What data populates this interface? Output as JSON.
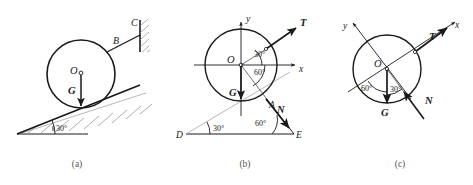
{
  "figure": {
    "background_color": "#ffffff",
    "line_color": "#1a1a1a",
    "grey_color": "#9a9a9a",
    "width": 473,
    "height": 185
  },
  "panels": [
    {
      "id": "a",
      "caption": "(a)",
      "caption_x": 77,
      "caption_y": 167,
      "description": "Cylinder resting on a 30 degree incline, tied by cord B to wall C",
      "circle": {
        "cx": 81,
        "cy": 74,
        "r": 34
      },
      "labels": [
        {
          "name": "center-label-o",
          "text": "O",
          "x": 70,
          "y": 74,
          "style": "italic"
        },
        {
          "name": "weight-label-g",
          "text": "G",
          "x": 68,
          "y": 94,
          "style": "bold-italic"
        },
        {
          "name": "cord-label-b",
          "text": "B",
          "x": 113,
          "y": 44,
          "style": "italic"
        },
        {
          "name": "wall-label-c",
          "text": "C",
          "x": 131,
          "y": 26,
          "style": "italic"
        },
        {
          "name": "incline-angle-label",
          "text": "30°",
          "x": 48,
          "y": 130,
          "style": "angle"
        }
      ]
    },
    {
      "id": "b",
      "caption": "(b)",
      "caption_x": 245,
      "caption_y": 167,
      "description": "Free body diagram with xy axes at O, forces T, G, N and triangle DAE",
      "circle": {
        "cx": 241,
        "cy": 65,
        "r": 36
      },
      "labels": [
        {
          "name": "center-label-o",
          "text": "O",
          "x": 229,
          "y": 64,
          "style": "italic"
        },
        {
          "name": "axis-label-y",
          "text": "y",
          "x": 246,
          "y": 18,
          "style": "italic"
        },
        {
          "name": "axis-label-x",
          "text": "x",
          "x": 298,
          "y": 72,
          "style": "italic"
        },
        {
          "name": "tension-label-t",
          "text": "T",
          "x": 302,
          "y": 25,
          "style": "bold-italic"
        },
        {
          "name": "weight-label-g",
          "text": "G",
          "x": 231,
          "y": 95,
          "style": "bold-italic"
        },
        {
          "name": "normal-label-n",
          "text": "N",
          "x": 276,
          "y": 113,
          "style": "bold-italic"
        },
        {
          "name": "contact-point-label-a",
          "text": "A",
          "x": 270,
          "y": 106,
          "style": "italic"
        },
        {
          "name": "vertex-label-d",
          "text": "D",
          "x": 178,
          "y": 137,
          "style": "italic"
        },
        {
          "name": "vertex-label-e",
          "text": "E",
          "x": 296,
          "y": 137,
          "style": "italic"
        },
        {
          "name": "angle-label-30-top",
          "text": "30°",
          "x": 255,
          "y": 58,
          "style": "angle"
        },
        {
          "name": "angle-label-60-top",
          "text": "60°",
          "x": 255,
          "y": 73,
          "style": "angle"
        },
        {
          "name": "angle-label-30-bottom",
          "text": "30°",
          "x": 196,
          "y": 131,
          "style": "angle"
        },
        {
          "name": "angle-label-60-bottom",
          "text": "60°",
          "x": 258,
          "y": 127,
          "style": "angle"
        }
      ]
    },
    {
      "id": "c",
      "caption": "(c)",
      "caption_x": 400,
      "caption_y": 167,
      "description": "Rotated axes free body diagram with forces T, G, N and angles 60 and 30",
      "circle": {
        "cx": 387,
        "cy": 69,
        "r": 34
      },
      "labels": [
        {
          "name": "center-label-o",
          "text": "O",
          "x": 376,
          "y": 65,
          "style": "italic"
        },
        {
          "name": "axis-label-y",
          "text": "y",
          "x": 345,
          "y": 27,
          "style": "italic"
        },
        {
          "name": "axis-label-x",
          "text": "x",
          "x": 456,
          "y": 26,
          "style": "italic"
        },
        {
          "name": "tension-label-t",
          "text": "T",
          "x": 432,
          "y": 38,
          "style": "bold-italic"
        },
        {
          "name": "weight-label-g",
          "text": "G",
          "x": 383,
          "y": 113,
          "style": "bold-italic"
        },
        {
          "name": "normal-label-n",
          "text": "N",
          "x": 424,
          "y": 103,
          "style": "bold-italic"
        },
        {
          "name": "angle-label-60",
          "text": "60°",
          "x": 364,
          "y": 90,
          "style": "angle"
        },
        {
          "name": "angle-label-30",
          "text": "30°",
          "x": 392,
          "y": 91,
          "style": "angle"
        }
      ]
    }
  ]
}
